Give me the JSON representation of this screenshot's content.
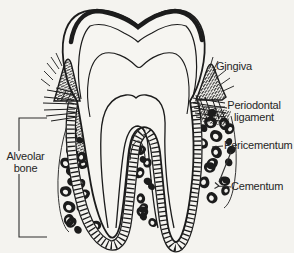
{
  "diagram": {
    "labels": {
      "gingiva": "Gingiva",
      "periodontal_line1": "Periodontal",
      "periodontal_line2": "ligament",
      "pericementum": "Pericementum",
      "cementum": "Cementum",
      "alveolar_line1": "Alveolar",
      "alveolar_line2": "bone"
    },
    "colors": {
      "ink": "#1c1c1c",
      "background": "#f4f3ef",
      "label_text": "#262626"
    }
  }
}
